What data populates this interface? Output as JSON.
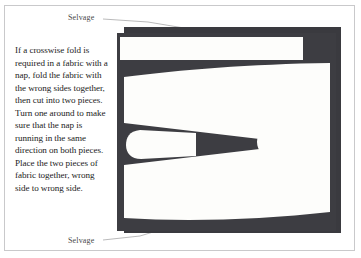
{
  "figure": {
    "caption_text": "If a crosswise fold is required in a fabric with a nap, fold the fabric with the wrong sides together, then cut into two pieces. Turn one around to make sure that the nap is running in the same direction on both pieces. Place the two pieces of fabric together, wrong side to wrong side.",
    "labels": {
      "selvage_top": "Selvage",
      "selvage_bottom": "Selvage"
    },
    "colors": {
      "page_background": "#ffffff",
      "page_border": "#c9c9cb",
      "fabric_dark": "#3d3d42",
      "fabric_back_layer": "#35353a",
      "pattern_piece_white": "#fdfdfb",
      "text": "#1b1b1b",
      "label_text": "#4a4a4a",
      "leader_line": "#a8a8aa"
    },
    "diagram": {
      "description": "Folded fabric with nap shown as a dark rectangle overlaid by white cut pattern pieces",
      "parts": [
        {
          "name": "back-fabric-layer",
          "kind": "rectangle"
        },
        {
          "name": "front-fabric-layer",
          "kind": "rectangle"
        },
        {
          "name": "top-pattern-strip",
          "kind": "white-piece"
        },
        {
          "name": "upper-pattern-piece",
          "kind": "white-piece"
        },
        {
          "name": "left-bulb-piece",
          "kind": "white-piece"
        },
        {
          "name": "right-bulb-piece",
          "kind": "white-piece"
        },
        {
          "name": "lower-pattern-piece",
          "kind": "white-piece"
        }
      ]
    }
  }
}
